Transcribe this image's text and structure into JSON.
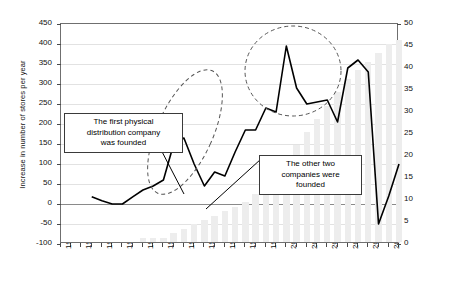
{
  "chart_data": {
    "type": "line",
    "title": "",
    "xlabel": "",
    "x": [
      1978,
      1979,
      1980,
      1981,
      1982,
      1983,
      1984,
      1985,
      1986,
      1987,
      1988,
      1989,
      1990,
      1991,
      1992,
      1993,
      1994,
      1995,
      1996,
      1997,
      1998,
      1999,
      2000,
      2001,
      2002,
      2003,
      2004,
      2005,
      2006,
      2007,
      2008,
      2009,
      2010,
      2011
    ],
    "xlim": [
      1978,
      2011
    ],
    "xticks": [
      1978,
      1980,
      1982,
      1984,
      1986,
      1988,
      1990,
      1992,
      1994,
      1996,
      1998,
      2000,
      2002,
      2004,
      2006,
      2008,
      2010
    ],
    "grid": true,
    "legend_position": "none",
    "axes": [
      {
        "side": "left",
        "ylabel": "Increase in number of stores per year",
        "ylim": [
          -100,
          450
        ],
        "yticks": [
          -100,
          -50,
          0,
          50,
          100,
          150,
          200,
          250,
          300,
          350,
          400,
          450
        ]
      },
      {
        "side": "right",
        "ylabel": "Accumulated number of subsidiaries",
        "ylim": [
          0,
          50
        ],
        "yticks": [
          0,
          5,
          10,
          15,
          20,
          25,
          30,
          35,
          40,
          45,
          50
        ]
      }
    ],
    "series": [
      {
        "name": "Increase in number of stores per year",
        "type": "line",
        "axis": "left",
        "color": "#000000",
        "x": [
          1981,
          1982,
          1983,
          1984,
          1985,
          1986,
          1987,
          1988,
          1989,
          1990,
          1991,
          1992,
          1993,
          1994,
          1995,
          1996,
          1997,
          1998,
          1999,
          2000,
          2001,
          2002,
          2003,
          2004,
          2005,
          2006,
          2007,
          2008,
          2009,
          2010,
          2011
        ],
        "values": [
          18,
          8,
          0,
          0,
          18,
          35,
          45,
          60,
          150,
          165,
          100,
          45,
          80,
          70,
          130,
          185,
          185,
          240,
          230,
          395,
          290,
          250,
          255,
          260,
          205,
          340,
          360,
          330,
          -50,
          20,
          100
        ]
      },
      {
        "name": "Accumulated number of subsidiaries",
        "type": "bar",
        "axis": "right",
        "color": "#ededed",
        "x": [
          1986,
          1987,
          1988,
          1989,
          1990,
          1991,
          1992,
          1993,
          1994,
          1995,
          1996,
          1997,
          1998,
          1999,
          2000,
          2001,
          2002,
          2003,
          2004,
          2005,
          2006,
          2007,
          2008,
          2009,
          2010,
          2011
        ],
        "values": [
          1,
          1,
          1,
          2,
          3,
          4,
          5,
          6,
          7,
          8,
          9,
          11,
          13,
          16,
          19,
          22,
          25,
          28,
          31,
          34,
          37,
          39,
          41,
          43,
          45,
          46
        ]
      }
    ],
    "annotations": [
      {
        "name": "callout-first-company",
        "text": "The first physical distribution company was founded",
        "pointer_to_year": 1991
      },
      {
        "name": "callout-other-companies",
        "text": "The other two companies were founded",
        "pointer_to_year": 1998
      },
      {
        "name": "highlight-ellipse-1",
        "shape": "dashed-ellipse",
        "span_years": [
          1991,
          1999
        ]
      },
      {
        "name": "highlight-ellipse-2",
        "shape": "dashed-circle",
        "span_years": [
          1999,
          2007
        ]
      }
    ]
  },
  "callouts": {
    "first": {
      "line1": "The first physical",
      "line2": "distribution company",
      "line3": "was founded"
    },
    "second": {
      "line1": "The other two",
      "line2": "companies were",
      "line3": "founded"
    }
  }
}
